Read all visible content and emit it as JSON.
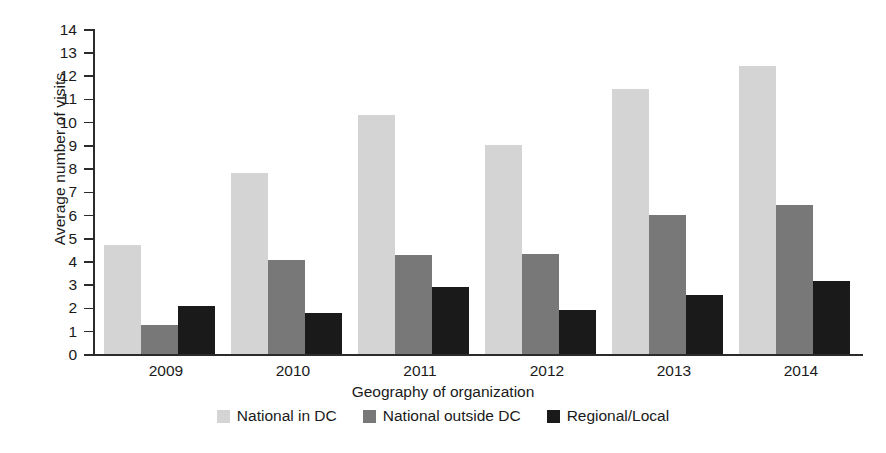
{
  "chart_data": {
    "type": "bar",
    "title": "",
    "xlabel": "Geography of organization",
    "ylabel": "Average number of visits",
    "categories": [
      "2009",
      "2010",
      "2011",
      "2012",
      "2013",
      "2014"
    ],
    "series": [
      {
        "name": "National in DC",
        "color": "#d4d4d4",
        "values": [
          4.7,
          7.8,
          10.3,
          9.0,
          11.4,
          12.4
        ]
      },
      {
        "name": "National outside DC",
        "color": "#787878",
        "values": [
          1.25,
          4.05,
          4.25,
          4.3,
          6.0,
          6.4
        ]
      },
      {
        "name": "Regional/Local",
        "color": "#1a1a1a",
        "values": [
          2.05,
          1.75,
          2.9,
          1.9,
          2.55,
          3.15
        ]
      }
    ],
    "ylim": [
      0,
      14
    ],
    "ytick_labels": [
      "0",
      "1",
      "2",
      "3",
      "4",
      "5",
      "6",
      "7",
      "8",
      "9",
      "10",
      "11",
      "12",
      "13",
      "14"
    ],
    "ytick_values": [
      0,
      1,
      2,
      3,
      4,
      5,
      6,
      7,
      8,
      9,
      10,
      11,
      12,
      13,
      14
    ],
    "ytick_step": 1,
    "grid": false,
    "legend_position": "bottom"
  }
}
